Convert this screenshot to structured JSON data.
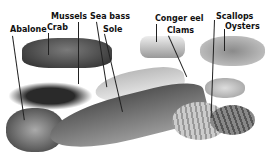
{
  "labels": {
    "abalone": "Abalone",
    "crab": "Crab",
    "mussels": "Mussels",
    "sea_bass": "Sea bass",
    "sole": "Sole",
    "conger_eel": "Conger eel",
    "clams": "Clams",
    "scallops": "Scallops",
    "oysters": "Oysters"
  }
}
